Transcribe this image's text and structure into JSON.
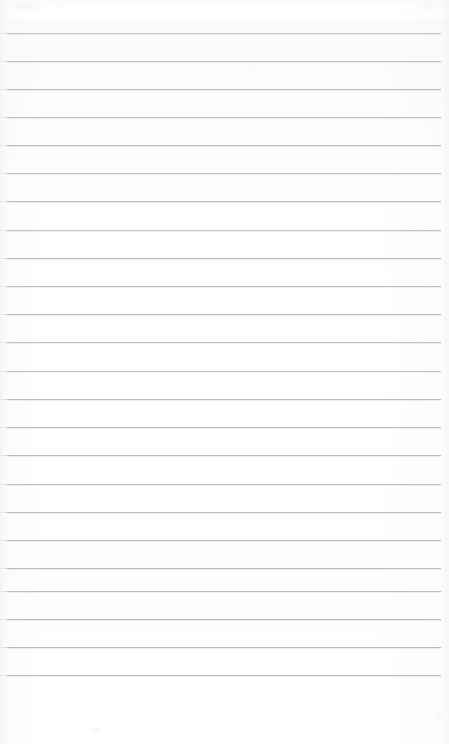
{
  "document": {
    "kind": "scanned-lined-page",
    "title": "",
    "body_text": "",
    "page_width": 449,
    "page_height": 744,
    "background_color": "#ffffff",
    "is_blank": true
  },
  "ruling": {
    "line_color": "#b4b6b9",
    "line_thickness": 1,
    "line_spacing": 28.2,
    "first_line_y": 33,
    "last_line_y": 675,
    "line_left_x": 7,
    "line_right_x": 441,
    "line_count": 24,
    "lines": [
      {
        "index": 1,
        "y": 33,
        "left": 7,
        "right": 441,
        "opacity": 0.78
      },
      {
        "index": 2,
        "y": 61,
        "left": 7,
        "right": 441,
        "opacity": 0.85
      },
      {
        "index": 3,
        "y": 89,
        "left": 7,
        "right": 441,
        "opacity": 0.9
      },
      {
        "index": 4,
        "y": 117,
        "left": 7,
        "right": 441,
        "opacity": 0.88
      },
      {
        "index": 5,
        "y": 145,
        "left": 7,
        "right": 441,
        "opacity": 0.92
      },
      {
        "index": 6,
        "y": 173,
        "left": 7,
        "right": 441,
        "opacity": 0.86
      },
      {
        "index": 7,
        "y": 201,
        "left": 7,
        "right": 441,
        "opacity": 0.9
      },
      {
        "index": 8,
        "y": 230,
        "left": 7,
        "right": 441,
        "opacity": 0.84
      },
      {
        "index": 9,
        "y": 258,
        "left": 7,
        "right": 441,
        "opacity": 0.9
      },
      {
        "index": 10,
        "y": 286,
        "left": 7,
        "right": 441,
        "opacity": 0.88
      },
      {
        "index": 11,
        "y": 314,
        "left": 7,
        "right": 441,
        "opacity": 0.92
      },
      {
        "index": 12,
        "y": 342,
        "left": 7,
        "right": 441,
        "opacity": 0.86
      },
      {
        "index": 13,
        "y": 371,
        "left": 7,
        "right": 441,
        "opacity": 0.8
      },
      {
        "index": 14,
        "y": 399,
        "left": 7,
        "right": 441,
        "opacity": 0.9
      },
      {
        "index": 15,
        "y": 427,
        "left": 7,
        "right": 441,
        "opacity": 0.88
      },
      {
        "index": 16,
        "y": 455,
        "left": 7,
        "right": 441,
        "opacity": 0.92
      },
      {
        "index": 17,
        "y": 484,
        "left": 7,
        "right": 441,
        "opacity": 0.84
      },
      {
        "index": 18,
        "y": 512,
        "left": 7,
        "right": 441,
        "opacity": 0.9
      },
      {
        "index": 19,
        "y": 540,
        "left": 7,
        "right": 441,
        "opacity": 0.88
      },
      {
        "index": 20,
        "y": 568,
        "left": 7,
        "right": 441,
        "opacity": 0.92
      },
      {
        "index": 21,
        "y": 591,
        "left": 7,
        "right": 441,
        "opacity": 0.86
      },
      {
        "index": 22,
        "y": 619,
        "left": 7,
        "right": 441,
        "opacity": 0.9
      },
      {
        "index": 23,
        "y": 647,
        "left": 7,
        "right": 441,
        "opacity": 0.92
      },
      {
        "index": 24,
        "y": 675,
        "left": 7,
        "right": 441,
        "opacity": 0.88
      }
    ]
  },
  "margins": {
    "top_margin_height": 33,
    "bottom_margin_height": 69,
    "bottom_margin_note": ""
  },
  "artifacts": [
    {
      "name": "top-left-smudge",
      "x": 14,
      "y": 0,
      "width": 34,
      "height": 11
    },
    {
      "name": "top-left-speck",
      "x": 52,
      "y": 1,
      "width": 16,
      "height": 9
    },
    {
      "name": "top-right-speck",
      "x": 418,
      "y": 2,
      "width": 18,
      "height": 10
    },
    {
      "name": "bottom-left-speck",
      "x": 88,
      "y": 726,
      "width": 14,
      "height": 8
    },
    {
      "name": "bottom-right-speck",
      "x": 432,
      "y": 712,
      "width": 12,
      "height": 8
    }
  ]
}
